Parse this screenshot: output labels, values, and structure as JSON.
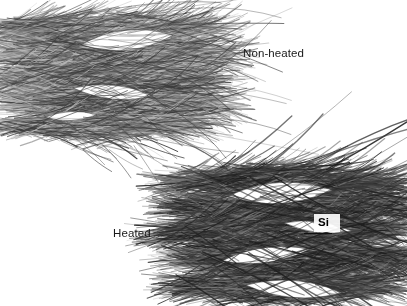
{
  "figure": {
    "kind": "sem-micrograph-comparison",
    "background_color": "#ffffff",
    "width": 407,
    "height": 306,
    "palette": {
      "background": "#ffffff",
      "fiber_light": "#b8b8b8",
      "fiber_mid": "#7a7a7a",
      "fiber_dark": "#3c3c3c",
      "fiber_darkest": "#1e1e1e",
      "label_text": "#1a1a1a",
      "annotation_text": "#000000",
      "leader_line": "#111111"
    },
    "specimens": [
      {
        "id": "non-heated",
        "label": "Non-heated",
        "label_position": {
          "x": 243,
          "y": 47
        },
        "mass_bounds": {
          "x": 8,
          "y": 6,
          "width": 214,
          "height": 140
        },
        "density": "moderate",
        "description": "loosely packed wavy fiber bundles with open lens-shaped voids"
      },
      {
        "id": "heated",
        "label": "Heated",
        "label_position": {
          "x": 113,
          "y": 227
        },
        "mass_bounds": {
          "x": 180,
          "y": 160,
          "width": 216,
          "height": 146
        },
        "density": "dense",
        "description": "compacted darker fiber bundles with pronounced lens-shaped voids"
      }
    ],
    "annotations": [
      {
        "id": "si",
        "text": "Si",
        "bold": true,
        "position": {
          "x": 318,
          "y": 216
        },
        "leader_line": {
          "x1": 332,
          "y1": 233,
          "x2": 304,
          "y2": 233
        },
        "points_to": "heated"
      }
    ]
  }
}
